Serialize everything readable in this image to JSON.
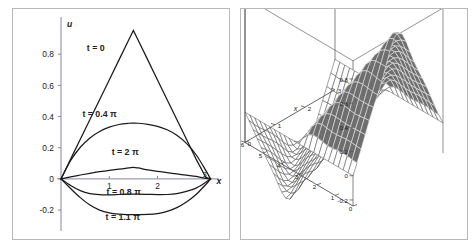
{
  "figure": {
    "panels": [
      "2d-line-plot",
      "3d-surface-plot"
    ],
    "background_color": "#ffffff",
    "frame_color": "#b9b9b9",
    "curve_color": "#1a1a1a",
    "axis_color": "#7c7c9a",
    "surface_fill_color": "#6e6e6e",
    "surface_mesh_color": "#3a3a3a"
  },
  "chart_data": [
    {
      "type": "line",
      "id": "wave-profiles",
      "title": "",
      "xlabel": "x",
      "ylabel": "u",
      "xlim": [
        0,
        3.15
      ],
      "ylim": [
        -0.27,
        1.0
      ],
      "xticks": [
        1,
        2,
        3
      ],
      "xtick_labels": [
        "1",
        "2",
        "3"
      ],
      "yticks": [
        -0.2,
        0,
        0.2,
        0.4,
        0.6,
        0.8
      ],
      "ytick_labels": [
        "-0.2",
        "0",
        "0.2",
        "0.4",
        "0.6",
        "0.8"
      ],
      "grid": false,
      "legend": "inline-annotations",
      "annotations": [
        {
          "label": "t = 0",
          "x": 0.72,
          "y": 0.82
        },
        {
          "label": "t = 0.4 π",
          "x": 0.8,
          "y": 0.395
        },
        {
          "label": "t = 2 π",
          "x": 1.33,
          "y": 0.155
        },
        {
          "label": "t = 0.8 π",
          "x": 1.3,
          "y": -0.105
        },
        {
          "label": "t = 1.1 π",
          "x": 1.28,
          "y": -0.262
        }
      ],
      "series": [
        {
          "name": "t = 0",
          "label": "t = 0",
          "x": [
            0,
            0.2,
            0.4,
            0.6,
            0.8,
            1.0,
            1.2,
            1.4,
            1.5,
            1.6,
            1.8,
            2.0,
            2.2,
            2.4,
            2.6,
            2.8,
            3.0,
            3.1
          ],
          "values": [
            0,
            0.127,
            0.254,
            0.381,
            0.508,
            0.635,
            0.762,
            0.889,
            0.952,
            0.889,
            0.762,
            0.635,
            0.508,
            0.381,
            0.254,
            0.127,
            0.01,
            0
          ]
        },
        {
          "name": "t = 0.4 pi",
          "label": "t = 0.4 π",
          "x": [
            0,
            0.2,
            0.4,
            0.6,
            0.8,
            1.0,
            1.2,
            1.4,
            1.5,
            1.6,
            1.8,
            2.0,
            2.2,
            2.4,
            2.6,
            2.8,
            3.0,
            3.1
          ],
          "values": [
            0,
            0.118,
            0.203,
            0.263,
            0.304,
            0.332,
            0.349,
            0.357,
            0.358,
            0.357,
            0.35,
            0.337,
            0.315,
            0.28,
            0.228,
            0.155,
            0.055,
            0
          ]
        },
        {
          "name": "t = 2 pi",
          "label": "t = 2 π",
          "x": [
            0,
            0.2,
            0.4,
            0.6,
            0.8,
            1.0,
            1.2,
            1.4,
            1.5,
            1.6,
            1.8,
            2.0,
            2.2,
            2.4,
            2.6,
            2.8,
            3.0,
            3.1
          ],
          "values": [
            0,
            0.013,
            0.025,
            0.036,
            0.046,
            0.054,
            0.062,
            0.07,
            0.074,
            0.07,
            0.058,
            0.048,
            0.04,
            0.032,
            0.024,
            0.016,
            0.004,
            0
          ]
        },
        {
          "name": "t = 0.8 pi",
          "label": "t = 0.8 π",
          "x": [
            0,
            0.2,
            0.4,
            0.6,
            0.8,
            1.0,
            1.2,
            1.4,
            1.5,
            1.6,
            1.8,
            2.0,
            2.2,
            2.4,
            2.6,
            2.8,
            3.0,
            3.1
          ],
          "values": [
            0,
            -0.042,
            -0.075,
            -0.094,
            -0.101,
            -0.102,
            -0.1,
            -0.098,
            -0.098,
            -0.098,
            -0.099,
            -0.101,
            -0.1,
            -0.094,
            -0.08,
            -0.059,
            -0.022,
            0
          ]
        },
        {
          "name": "t = 1.1 pi",
          "label": "t = 1.1 π",
          "x": [
            0,
            0.2,
            0.4,
            0.6,
            0.8,
            1.0,
            1.2,
            1.4,
            1.5,
            1.6,
            1.8,
            2.0,
            2.2,
            2.4,
            2.6,
            2.8,
            3.0,
            3.1
          ],
          "values": [
            0,
            -0.062,
            -0.12,
            -0.168,
            -0.2,
            -0.218,
            -0.226,
            -0.229,
            -0.229,
            -0.229,
            -0.228,
            -0.222,
            -0.208,
            -0.184,
            -0.148,
            -0.1,
            -0.036,
            0
          ]
        }
      ]
    },
    {
      "type": "surface",
      "id": "wave-surface",
      "title": "",
      "xlabel": "x",
      "ylabel": "t",
      "zlabel": "",
      "xlim": [
        0,
        3
      ],
      "ylim": [
        0,
        6
      ],
      "zlim": [
        -0.25,
        0.95
      ],
      "xticks": [
        0,
        1,
        2,
        3
      ],
      "xtick_labels": [
        "0",
        "1",
        "2",
        "3"
      ],
      "yticks": [
        0,
        1,
        2,
        3,
        4,
        5,
        6
      ],
      "ytick_labels": [
        "0",
        "1",
        "2",
        "3",
        "4",
        "5",
        "6"
      ],
      "zticks": [
        -0.2,
        0,
        0.2,
        0.4,
        0.6,
        0.8
      ],
      "ztick_labels": [
        "-0.2",
        "0",
        "0.2",
        "0.4",
        "0.6",
        "0.8"
      ],
      "grid": true,
      "mesh_nx": 22,
      "mesh_ny": 22,
      "description": "u(x,t) wave solution surface, triangular peak at t=0 decaying in t"
    }
  ]
}
